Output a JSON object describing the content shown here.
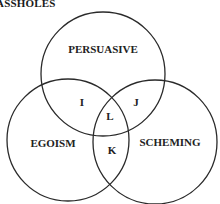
{
  "title": "ASSHOLES",
  "circles": [
    {
      "label": "PERSUASIVE",
      "cx": 103,
      "cy": 74,
      "r": 62
    },
    {
      "label": "EGOISM",
      "cx": 68,
      "cy": 140,
      "r": 61
    },
    {
      "label": "SCHEMING",
      "cx": 155,
      "cy": 142,
      "r": 62
    }
  ],
  "regions": {
    "I": "I",
    "J": "J",
    "K": "K",
    "L": "L"
  },
  "colors": {
    "stroke": "#2a2a2a",
    "text": "#222222",
    "background": "#ffffff"
  }
}
